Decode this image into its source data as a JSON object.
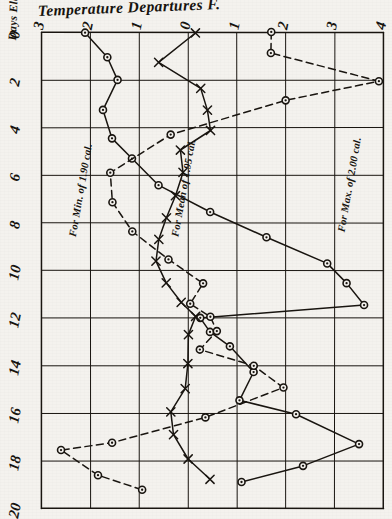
{
  "chart_data": {
    "type": "line",
    "title": "Temperature Departures F.",
    "xlabel": "Temperature Departures F.",
    "ylabel": "Days Elapsed after Solar Observation.",
    "xlim": [
      -3,
      4
    ],
    "ylim": [
      0,
      20
    ],
    "x_ticklabels": [
      "3",
      "2",
      "1",
      "0",
      "1",
      "2",
      "3",
      "4"
    ],
    "x_tickvalues": [
      -3,
      -2,
      -1,
      0,
      1,
      2,
      3,
      4
    ],
    "y_ticklabels": [
      "0",
      "2",
      "4",
      "6",
      "8",
      "10",
      "12",
      "14",
      "16",
      "18",
      "20"
    ],
    "y_tickvalues": [
      0,
      2,
      4,
      6,
      8,
      10,
      12,
      14,
      16,
      18,
      20
    ],
    "grid": true,
    "legend_position": "inline-annotations",
    "series": [
      {
        "name": "For Mean of 1.95 cal.",
        "marker": "circle",
        "linestyle": "solid",
        "points": [
          [
            -2.1,
            0.0
          ],
          [
            -1.65,
            1.05
          ],
          [
            -1.45,
            2.0
          ],
          [
            -1.75,
            3.25
          ],
          [
            -1.55,
            4.45
          ],
          [
            -1.15,
            5.3
          ],
          [
            -0.6,
            6.4
          ],
          [
            0.45,
            7.55
          ],
          [
            1.6,
            8.6
          ],
          [
            2.85,
            9.7
          ],
          [
            3.25,
            10.55
          ],
          [
            3.6,
            11.45
          ],
          [
            0.25,
            12.0
          ],
          [
            0.45,
            12.6
          ],
          [
            0.85,
            13.2
          ],
          [
            1.35,
            14.25
          ],
          [
            1.05,
            15.45
          ],
          [
            2.2,
            16.05
          ],
          [
            3.5,
            17.3
          ],
          [
            2.35,
            18.2
          ],
          [
            1.1,
            18.9
          ]
        ]
      },
      {
        "name": "For Min. of 1.90 cal.",
        "marker": "circle",
        "linestyle": "dashed",
        "points": [
          [
            1.7,
            0.0
          ],
          [
            1.7,
            0.85
          ],
          [
            3.9,
            2.05
          ],
          [
            2.0,
            2.85
          ],
          [
            -0.35,
            4.3
          ],
          [
            -1.6,
            5.9
          ],
          [
            -1.55,
            7.15
          ],
          [
            -1.15,
            8.35
          ],
          [
            -0.4,
            9.55
          ],
          [
            0.3,
            10.55
          ],
          [
            0.05,
            11.4
          ],
          [
            0.45,
            11.95
          ],
          [
            0.6,
            12.55
          ],
          [
            0.25,
            13.3
          ],
          [
            1.35,
            14.0
          ],
          [
            1.95,
            14.9
          ],
          [
            0.35,
            16.15
          ],
          [
            -1.55,
            17.25
          ],
          [
            -2.6,
            17.55
          ],
          [
            -1.85,
            18.6
          ],
          [
            -0.95,
            19.2
          ]
        ]
      },
      {
        "name": "For Max. of 2.00 cal.",
        "marker": "x",
        "linestyle": "solid",
        "points": [
          [
            0.15,
            0.0
          ],
          [
            -0.6,
            1.25
          ],
          [
            0.25,
            2.35
          ],
          [
            0.4,
            3.25
          ],
          [
            0.45,
            4.1
          ],
          [
            -0.15,
            4.95
          ],
          [
            -0.1,
            5.9
          ],
          [
            -0.25,
            6.85
          ],
          [
            -0.45,
            7.8
          ],
          [
            -0.6,
            8.7
          ],
          [
            -0.65,
            9.6
          ],
          [
            -0.45,
            10.5
          ],
          [
            -0.15,
            11.35
          ],
          [
            0.15,
            11.95
          ],
          [
            0.0,
            12.7
          ],
          [
            0.0,
            13.9
          ],
          [
            -0.05,
            14.95
          ],
          [
            -0.35,
            15.95
          ],
          [
            -0.3,
            16.9
          ],
          [
            0.0,
            17.9
          ],
          [
            0.45,
            18.75
          ]
        ]
      }
    ],
    "annotations": [
      {
        "text": "For Min. of 1.90 cal.",
        "x": -2.3,
        "y": 8.6
      },
      {
        "text": "For Mean of 1.95 cal.",
        "x": -0.2,
        "y": 8.6
      },
      {
        "text": "For Max. of 2.00 cal.",
        "x": 3.2,
        "y": 8.4
      }
    ]
  }
}
